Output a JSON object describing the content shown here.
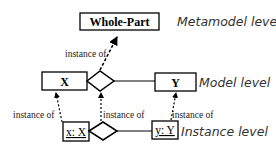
{
  "diagram": {
    "type": "metamodel-hierarchy",
    "levels": [
      {
        "label": "Metamodel level"
      },
      {
        "label": "Model level"
      },
      {
        "label": "Instance level"
      }
    ],
    "nodes": {
      "whole_part": {
        "label": "Whole-Part"
      },
      "x": {
        "label": "X"
      },
      "y": {
        "label": "Y"
      },
      "x_instance": {
        "label": "x: X"
      },
      "y_instance": {
        "label": "y: Y"
      }
    },
    "edges": {
      "model_to_meta": {
        "label": "instance of"
      },
      "xinst_to_x": {
        "label": "instance of"
      },
      "diamond_inst_to_diamond": {
        "label": "instance of"
      },
      "yinst_to_y": {
        "label": "instance of"
      }
    },
    "colors": {
      "stroke": "#000000",
      "level_text": "#333333",
      "background": "#ffffff"
    }
  }
}
